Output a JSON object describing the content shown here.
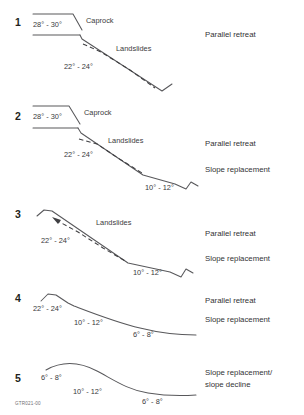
{
  "figure": {
    "credit": "GTR021-00",
    "stroke_color": "#58585b",
    "text_color": "#231f20"
  },
  "panels": [
    {
      "number": "1",
      "caprock_label": "Caprock",
      "landslides_label": "Landslides",
      "angles": [
        "28° - 30°",
        "22° - 24°"
      ],
      "processes": [
        "Parallel retreat"
      ]
    },
    {
      "number": "2",
      "caprock_label": "Caprock",
      "landslides_label": "Landslides",
      "angles": [
        "28° - 30°",
        "22° - 24°",
        "10° - 12°"
      ],
      "processes": [
        "Parallel retreat",
        "Slope replacement"
      ]
    },
    {
      "number": "3",
      "caprock_label": "",
      "landslides_label": "Landslides",
      "angles": [
        "22° - 24°",
        "10° - 12°"
      ],
      "processes": [
        "Parallel retreat",
        "Slope replacement"
      ]
    },
    {
      "number": "4",
      "caprock_label": "",
      "landslides_label": "",
      "angles": [
        "22° - 24°",
        "10° - 12°",
        "6° - 8°"
      ],
      "processes": [
        "Parallel retreat",
        "Slope replacement"
      ]
    },
    {
      "number": "5",
      "caprock_label": "",
      "landslides_label": "",
      "angles": [
        "6° - 8°",
        "10° - 12°",
        "6° - 8°"
      ],
      "processes": [
        "Slope replacement/",
        "slope decline"
      ]
    }
  ]
}
